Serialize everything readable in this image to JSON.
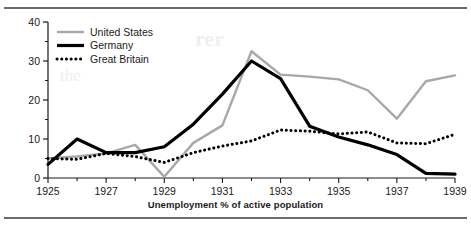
{
  "figure": {
    "caption": "Unemployment % of active population",
    "colors": {
      "united_states": "#a8a8a8",
      "germany": "#000000",
      "great_britain": "#000000",
      "axis": "#1a1a1a",
      "rule": "#6b6b6b",
      "background": "#ffffff"
    }
  },
  "chart_data": {
    "type": "line",
    "title": "",
    "xlabel": "Unemployment % of active population",
    "ylabel": "",
    "xlim": [
      1925,
      1939
    ],
    "ylim": [
      0,
      40
    ],
    "grid": false,
    "legend_position": "top-left",
    "x": [
      1925,
      1926,
      1927,
      1928,
      1929,
      1930,
      1931,
      1932,
      1933,
      1934,
      1935,
      1936,
      1937,
      1938,
      1939
    ],
    "yticks": [
      0,
      10,
      20,
      30,
      40
    ],
    "ytick_labels": [
      "0",
      "10",
      "20",
      "30",
      "40"
    ],
    "xticks": [
      1925,
      1926,
      1927,
      1928,
      1929,
      1930,
      1931,
      1932,
      1933,
      1934,
      1935,
      1936,
      1937,
      1938,
      1939
    ],
    "xtick_labels": [
      "1925",
      "",
      "1927",
      "",
      "1929",
      "",
      "1931",
      "",
      "1933",
      "",
      "1935",
      "",
      "1937",
      "",
      "1939"
    ],
    "series": [
      {
        "name": "United States",
        "style": "solid",
        "color": "#a8a8a8",
        "width": 2.4,
        "values": [
          5.0,
          5.5,
          6.3,
          8.5,
          0.3,
          9.0,
          13.5,
          32.5,
          26.5,
          26.0,
          25.3,
          22.5,
          15.2,
          24.8,
          26.3
        ]
      },
      {
        "name": "Germany",
        "style": "solid",
        "color": "#000000",
        "width": 3.2,
        "values": [
          3.5,
          10.0,
          6.5,
          6.5,
          8.0,
          13.8,
          21.5,
          30.0,
          25.5,
          13.3,
          10.5,
          8.5,
          6.0,
          1.2,
          1.0
        ]
      },
      {
        "name": "Great Britain",
        "style": "dotted",
        "color": "#000000",
        "width": 3.0,
        "values": [
          5.0,
          4.8,
          6.3,
          5.5,
          4.0,
          6.5,
          8.2,
          9.5,
          12.3,
          12.0,
          11.3,
          11.8,
          9.0,
          8.8,
          11.2
        ]
      }
    ],
    "legend": [
      {
        "label": "United States",
        "style": "solid",
        "color": "#a8a8a8"
      },
      {
        "label": "Germany",
        "style": "solid",
        "color": "#000000"
      },
      {
        "label": "Great Britain",
        "style": "dotted",
        "color": "#000000"
      }
    ]
  },
  "bleed_text": {
    "line1": "rer",
    "line2": "the",
    "line3": "of"
  }
}
